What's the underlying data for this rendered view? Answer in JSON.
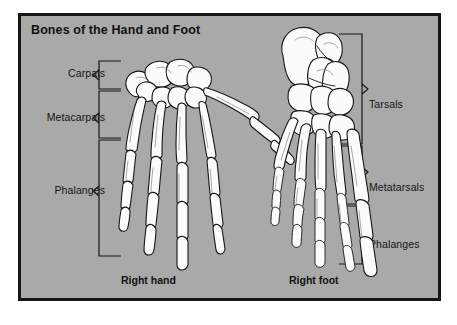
{
  "figure": {
    "title": "Bones of the Hand and Foot",
    "background_color": "#a9a9a9",
    "border_color": "#151515",
    "bone_fill_color": "#fbfbfb",
    "bone_outline_color": "#161616"
  },
  "hand": {
    "caption": "Right hand",
    "labels": [
      {
        "text": "Carpals",
        "group": "carpals"
      },
      {
        "text": "Metacarpals",
        "group": "metacarpals"
      },
      {
        "text": "Phalanges",
        "group": "phalanges"
      }
    ]
  },
  "foot": {
    "caption": "Right foot",
    "labels": [
      {
        "text": "Tarsals",
        "group": "tarsals"
      },
      {
        "text": "Metatarsals",
        "group": "metatarsals"
      },
      {
        "text": "Phalanges",
        "group": "phalanges"
      }
    ]
  }
}
